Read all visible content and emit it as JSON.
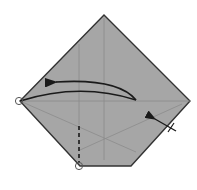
{
  "diagram": {
    "type": "origami-fold-step",
    "colors": {
      "paper": "#a6a6a6",
      "outline": "#333333",
      "crease": "#8c8c8c",
      "arrow": "#1a1a1a",
      "background": "#ffffff",
      "circle_marker": "#555555"
    },
    "paper_outline": [
      [
        104,
        15
      ],
      [
        190,
        101
      ],
      [
        131,
        166
      ],
      [
        80,
        166
      ],
      [
        20,
        101
      ]
    ],
    "creases": [
      {
        "name": "vertical-center",
        "from": [
          104,
          15
        ],
        "to": [
          104,
          160
        ]
      },
      {
        "name": "vertical-left",
        "from": [
          79,
          45
        ],
        "to": [
          79,
          125
        ]
      },
      {
        "name": "horizontal-middle",
        "from": [
          20,
          101
        ],
        "to": [
          190,
          101
        ]
      },
      {
        "name": "diagonal-left-down",
        "from": [
          20,
          101
        ],
        "to": [
          136,
          152
        ]
      },
      {
        "name": "diagonal-right-down",
        "from": [
          182,
          104
        ],
        "to": [
          80,
          150
        ]
      }
    ],
    "valley_fold_line": {
      "from": [
        79,
        125
      ],
      "to": [
        79,
        164
      ]
    },
    "fold_arrow": {
      "start": [
        136,
        100
      ],
      "end": [
        54,
        82
      ]
    },
    "push_arrow": {
      "start": [
        176,
        131
      ],
      "end": [
        152,
        118
      ]
    },
    "reference_points": [
      {
        "name": "left-corner-marker",
        "x": 20,
        "y": 101
      },
      {
        "name": "bottom-corner-marker",
        "x": 80,
        "y": 166
      }
    ]
  }
}
